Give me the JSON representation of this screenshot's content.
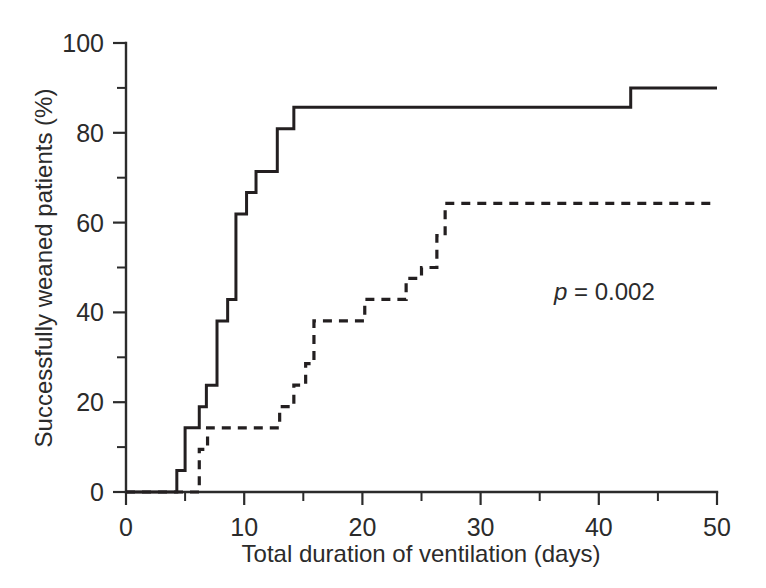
{
  "chart_data": {
    "type": "line",
    "subtype": "step-kaplan-meier-cumulative-incidence",
    "title": "",
    "xlabel": "Total duration of ventilation (days)",
    "ylabel": "Successfully weaned patients (%)",
    "xlim": [
      0,
      50
    ],
    "ylim": [
      0,
      100
    ],
    "grid": false,
    "legend": "none",
    "x_ticks_major": [
      0,
      10,
      20,
      30,
      40,
      50
    ],
    "x_ticks_major_labels": [
      "0",
      "10",
      "20",
      "30",
      "40",
      "50"
    ],
    "x_ticks_minor": [
      5,
      15,
      25,
      35,
      45
    ],
    "y_ticks_major": [
      0,
      20,
      40,
      60,
      80,
      100
    ],
    "y_ticks_major_labels": [
      "0",
      "20",
      "40",
      "60",
      "80",
      "100"
    ],
    "y_ticks_minor": [
      10,
      30,
      50,
      70,
      90
    ],
    "annotations": [
      {
        "name": "p-value",
        "italic_part": "p",
        "rest": " = 0.002",
        "full_text": "p = 0.002",
        "x": 33.0,
        "y": 45.0
      }
    ],
    "series": [
      {
        "name": "solid-curve",
        "style": "solid",
        "color": "#231f20",
        "steps": [
          [
            0,
            0
          ],
          [
            4.3,
            0
          ],
          [
            4.3,
            4.8
          ],
          [
            5.0,
            4.8
          ],
          [
            5.0,
            14.3
          ],
          [
            6.2,
            14.3
          ],
          [
            6.2,
            19.0
          ],
          [
            6.8,
            19.0
          ],
          [
            6.8,
            23.8
          ],
          [
            7.7,
            23.8
          ],
          [
            7.7,
            38.1
          ],
          [
            8.6,
            38.1
          ],
          [
            8.6,
            42.9
          ],
          [
            9.3,
            42.9
          ],
          [
            9.3,
            61.9
          ],
          [
            10.2,
            61.9
          ],
          [
            10.2,
            66.7
          ],
          [
            11.0,
            66.7
          ],
          [
            11.0,
            71.4
          ],
          [
            12.8,
            71.4
          ],
          [
            12.8,
            80.9
          ],
          [
            14.2,
            80.9
          ],
          [
            14.2,
            85.7
          ],
          [
            42.7,
            85.7
          ],
          [
            42.7,
            90.0
          ],
          [
            50,
            90.0
          ]
        ]
      },
      {
        "name": "dashed-curve",
        "style": "dashed",
        "color": "#231f20",
        "steps": [
          [
            0,
            0
          ],
          [
            6.2,
            0
          ],
          [
            6.2,
            9.5
          ],
          [
            6.9,
            9.5
          ],
          [
            6.9,
            14.3
          ],
          [
            13.0,
            14.3
          ],
          [
            13.0,
            19.0
          ],
          [
            14.2,
            19.0
          ],
          [
            14.2,
            23.8
          ],
          [
            15.2,
            23.8
          ],
          [
            15.2,
            28.6
          ],
          [
            15.9,
            28.6
          ],
          [
            15.9,
            38.1
          ],
          [
            20.2,
            38.1
          ],
          [
            20.2,
            42.9
          ],
          [
            23.7,
            42.9
          ],
          [
            23.7,
            47.6
          ],
          [
            25.0,
            47.6
          ],
          [
            25.0,
            50.0
          ],
          [
            26.3,
            50.0
          ],
          [
            26.3,
            57.1
          ],
          [
            27.0,
            57.1
          ],
          [
            27.0,
            64.3
          ],
          [
            50,
            64.3
          ]
        ]
      }
    ]
  },
  "axes": {
    "x_axis_name": "x-axis",
    "y_axis_name": "y-axis"
  }
}
